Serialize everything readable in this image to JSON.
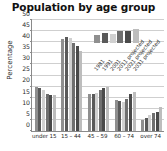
{
  "chart_data": {
    "type": "bar",
    "title": "Population by age group",
    "xlabel": "",
    "ylabel": "Percentage",
    "ylim": [
      0,
      50
    ],
    "yticks": [
      0,
      5,
      10,
      15,
      20,
      25,
      30,
      35,
      40,
      45,
      50
    ],
    "grid": true,
    "legend_position": "upper-right",
    "legend_rotated": true,
    "categories": [
      "under 15",
      "15 – 44",
      "45 – 59",
      "60 – 74",
      "over 74"
    ],
    "series": [
      {
        "name": "1981",
        "color": "#8f8f8f",
        "values": [
          20.0,
          41.5,
          16.5,
          14.0,
          5.0
        ]
      },
      {
        "name": "1991",
        "color": "#5a5a5a",
        "values": [
          19.5,
          42.5,
          16.5,
          13.5,
          6.0
        ]
      },
      {
        "name": "2001",
        "color": "#d0d0d0",
        "values": [
          18.5,
          42.0,
          17.0,
          13.0,
          7.0
        ]
      },
      {
        "name": "2011 projected",
        "color": "#6f6f6f",
        "values": [
          16.5,
          39.5,
          18.5,
          14.5,
          8.0
        ]
      },
      {
        "name": "2021 projected",
        "color": "#4a4a4a",
        "values": [
          16.0,
          38.5,
          19.5,
          16.5,
          8.5
        ]
      },
      {
        "name": "2031 projected",
        "color": "#bdbdbd",
        "values": [
          16.0,
          36.0,
          20.0,
          17.5,
          11.0
        ]
      }
    ]
  }
}
